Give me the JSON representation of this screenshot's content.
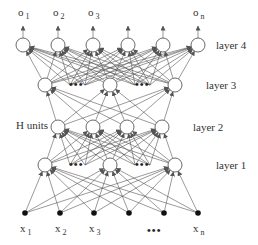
{
  "colors": {
    "edge": "#555555",
    "node_stroke": "#444444",
    "input_fill": "#111111",
    "text": "#333333"
  },
  "node_radius": 7,
  "layers": [
    {
      "id": "inputs",
      "label": "",
      "y": 213,
      "type": "input",
      "nodes": [
        25,
        60,
        94,
        129,
        164,
        198
      ],
      "ellipsis": []
    },
    {
      "id": "layer1",
      "label": "layer 1",
      "label_x": 216,
      "y": 165,
      "type": "hidden",
      "nodes": [
        45,
        110,
        175
      ],
      "ellipsis": [
        {
          "x": 77
        },
        {
          "x": 143
        }
      ]
    },
    {
      "id": "layer2",
      "label": "layer 2",
      "label_x": 193,
      "y": 127,
      "type": "hidden",
      "nodes": [
        58,
        93,
        127,
        162
      ],
      "ellipsis": []
    },
    {
      "id": "layer3",
      "label": "layer 3",
      "label_x": 206,
      "y": 85,
      "type": "hidden",
      "nodes": [
        45,
        110,
        175
      ],
      "ellipsis": [
        {
          "x": 77
        },
        {
          "x": 143
        }
      ]
    },
    {
      "id": "layer4",
      "label": "layer 4",
      "label_x": 216,
      "y": 45,
      "type": "output",
      "nodes": [
        23,
        58,
        93,
        128,
        163,
        198
      ],
      "ellipsis": []
    }
  ],
  "hidden_virtual_sources": {
    "layer1": [
      70,
      85,
      135,
      150
    ],
    "layer3": [
      70,
      85,
      135,
      150
    ]
  },
  "input_labels": [
    {
      "base": "x",
      "sub": "1",
      "x": 25
    },
    {
      "base": "x",
      "sub": "2",
      "x": 60
    },
    {
      "base": "x",
      "sub": "3",
      "x": 94
    },
    {
      "base": "x",
      "sub": "n",
      "x": 198
    }
  ],
  "input_ellipsis": {
    "text": "•••",
    "x": 155,
    "y": 232
  },
  "output_labels": [
    {
      "base": "o",
      "sub": "1",
      "x": 23
    },
    {
      "base": "o",
      "sub": "2",
      "x": 58
    },
    {
      "base": "o",
      "sub": "3",
      "x": 93
    },
    {
      "base": "o",
      "sub": "n",
      "x": 198
    }
  ],
  "h_units_label": "H units",
  "ellipsis_text": "•••"
}
